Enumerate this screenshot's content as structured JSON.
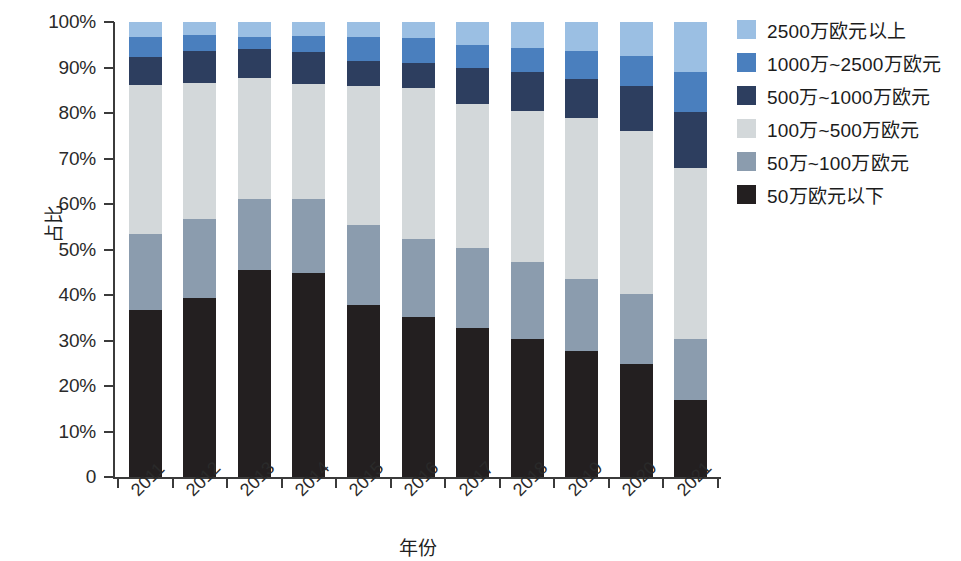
{
  "chart_data": {
    "type": "bar",
    "subtype": "stacked-percentage",
    "title": "",
    "xlabel": "年份",
    "ylabel": "占比",
    "ylim": [
      0,
      100
    ],
    "yticks": [
      0,
      10,
      20,
      30,
      40,
      50,
      60,
      70,
      80,
      90,
      100
    ],
    "ytick_labels": [
      "0",
      "10%",
      "20%",
      "30%",
      "40%",
      "50%",
      "60%",
      "70%",
      "80%",
      "90%",
      "100%"
    ],
    "grid": false,
    "legend_position": "right",
    "categories": [
      "2011",
      "2012",
      "2013",
      "2014",
      "2015",
      "2016",
      "2017",
      "2018",
      "2019",
      "2020",
      "2021"
    ],
    "series": [
      {
        "name": "50万欧元以下",
        "color": "#231f20",
        "values": [
          36.8,
          39.3,
          45.5,
          44.8,
          37.8,
          35.2,
          32.7,
          30.4,
          27.7,
          24.8,
          16.9
        ]
      },
      {
        "name": "50万~100万欧元",
        "color": "#8b9cae",
        "values": [
          16.5,
          17.4,
          15.7,
          16.4,
          17.5,
          17.1,
          17.6,
          16.9,
          15.9,
          15.5,
          13.4
        ]
      },
      {
        "name": "100万~500万欧元",
        "color": "#d3d8da",
        "values": [
          32.9,
          29.8,
          26.4,
          25.1,
          30.7,
          33.1,
          31.7,
          33.1,
          35.4,
          35.7,
          37.7
        ]
      },
      {
        "name": "500万~1000万欧元",
        "color": "#2d3e5f",
        "values": [
          6.1,
          7.2,
          6.5,
          7.2,
          5.4,
          5.6,
          8.0,
          8.6,
          8.4,
          10.0,
          12.2
        ]
      },
      {
        "name": "1000万~2500万欧元",
        "color": "#4a7fbe",
        "values": [
          4.4,
          3.4,
          2.5,
          3.4,
          5.3,
          5.5,
          5.0,
          5.2,
          6.3,
          6.5,
          8.8
        ]
      },
      {
        "name": "2500万欧元以上",
        "color": "#9bbfe3",
        "values": [
          3.3,
          2.9,
          3.4,
          3.1,
          3.3,
          3.5,
          5.0,
          5.8,
          6.3,
          7.5,
          11.0
        ]
      }
    ],
    "legend_entries": [
      "2500万欧元以上",
      "1000万~2500万欧元",
      "500万~1000万欧元",
      "100万~500万欧元",
      "50万~100万欧元",
      "50万欧元以下"
    ],
    "legend_colors": [
      "#9bbfe3",
      "#4a7fbe",
      "#2d3e5f",
      "#d3d8da",
      "#8b9cae",
      "#231f20"
    ]
  }
}
